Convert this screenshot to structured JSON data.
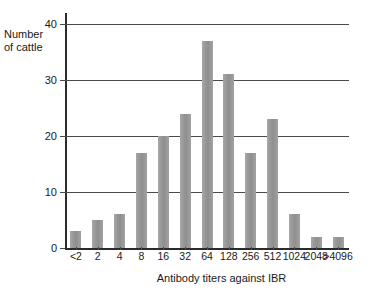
{
  "chart_data": {
    "type": "bar",
    "title": "",
    "xlabel": "Antibody titers against IBR",
    "ylabel": "Number\nof cattle",
    "categories": [
      "<2",
      "2",
      "4",
      "8",
      "16",
      "32",
      "64",
      "128",
      "256",
      "512",
      "1024",
      "2048",
      ">4096"
    ],
    "values": [
      3,
      5,
      6,
      17,
      20,
      24,
      37,
      31,
      17,
      23,
      6,
      2,
      2
    ],
    "ylim": [
      0,
      40
    ],
    "yticks": [
      0,
      10,
      20,
      30,
      40
    ],
    "ytick_labels": [
      "0",
      "10",
      "20",
      "30",
      "40"
    ],
    "grid": "horizontal",
    "legend": "none",
    "bar_color": "#979797",
    "axis_color": "#2b2b2b",
    "gridline_color": "#4a4a4a",
    "background": "#ffffff"
  },
  "axes": {
    "y_label_line1": "Number",
    "y_label_line2": "of cattle",
    "x_title": "Antibody titers against IBR"
  }
}
